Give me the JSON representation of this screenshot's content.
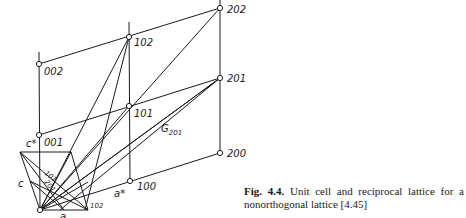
{
  "figure": {
    "points": {
      "p000": {
        "x": 40,
        "y": 210
      },
      "p100": {
        "x": 130,
        "y": 181
      },
      "p200": {
        "x": 220,
        "y": 153
      },
      "p001": {
        "x": 39,
        "y": 135
      },
      "p101": {
        "x": 129,
        "y": 106
      },
      "p201": {
        "x": 220,
        "y": 78
      },
      "p002": {
        "x": 39,
        "y": 64
      },
      "p102": {
        "x": 129,
        "y": 37
      },
      "p202": {
        "x": 220,
        "y": 8
      },
      "cell_a": {
        "x": 88,
        "y": 210
      },
      "cell_c": {
        "x": 20,
        "y": 152
      },
      "cell_ac": {
        "x": 71,
        "y": 152
      }
    },
    "labels": {
      "l002": "002",
      "l102": "102",
      "l202": "202",
      "l001": "001",
      "l101": "101",
      "l201": "201",
      "l100": "100",
      "l200": "200",
      "c_star": "c*",
      "a_star": "a*",
      "c": "c",
      "a": "a",
      "plane_101": "101",
      "plane_201": "201",
      "plane_102": "102",
      "g_vector": "G",
      "g_sub": "201"
    }
  },
  "caption": {
    "fig_label": "Fig. 4.4.",
    "text": "Unit cell and reciprocal lattice for a nonorthogonal lattice [4.45]"
  }
}
